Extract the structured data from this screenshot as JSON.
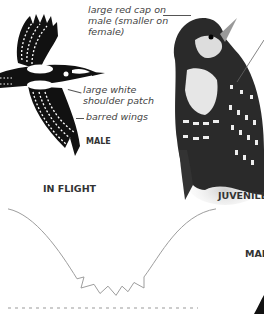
{
  "annotations": {
    "red_cap": [
      "large red cap on",
      "male (smaller on",
      "female)"
    ],
    "shoulder_patch": [
      "large white",
      "shoulder patch"
    ],
    "barred_wings": "barred wings"
  },
  "labels": {
    "male_small": "MALE",
    "in_flight": "IN FLIGHT",
    "juvenile": "JUVENILE",
    "male_cut": "MAL"
  },
  "colors": {
    "bird_black": "#111111",
    "text": "#444444",
    "flight_path": "#999999"
  }
}
